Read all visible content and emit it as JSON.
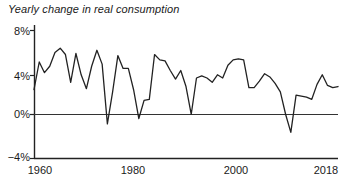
{
  "chart_data": {
    "type": "line",
    "title": "Yearly change in real consumption",
    "xlabel": "",
    "ylabel": "",
    "grid": false,
    "legend": null,
    "xlim": [
      1960,
      2018
    ],
    "ylim": [
      -4,
      8
    ],
    "yticks": [
      8,
      4,
      0,
      -4
    ],
    "ytick_labels": [
      "8%",
      "4%",
      "0%",
      "-4%"
    ],
    "xticks": [
      1960,
      1980,
      2000,
      2018
    ],
    "xtick_labels": [
      "1960",
      "1980",
      "2000",
      "2018"
    ],
    "zero_line": 0,
    "series": [
      {
        "name": "Yearly change in real consumption",
        "color": "#222222",
        "x": [
          1960,
          1961,
          1962,
          1963,
          1964,
          1965,
          1966,
          1967,
          1968,
          1969,
          1970,
          1971,
          1972,
          1973,
          1974,
          1975,
          1976,
          1977,
          1978,
          1979,
          1980,
          1981,
          1982,
          1983,
          1984,
          1985,
          1986,
          1987,
          1988,
          1989,
          1990,
          1991,
          1992,
          1993,
          1994,
          1995,
          1996,
          1997,
          1998,
          1999,
          2000,
          2001,
          2002,
          2003,
          2004,
          2005,
          2006,
          2007,
          2008,
          2009,
          2010,
          2011,
          2012,
          2013,
          2014,
          2015,
          2016,
          2017,
          2018
        ],
        "values": [
          2.4,
          5.0,
          4.0,
          4.6,
          5.9,
          6.3,
          5.7,
          3.1,
          5.8,
          3.8,
          2.5,
          4.6,
          6.1,
          4.8,
          -0.8,
          2.2,
          5.6,
          4.4,
          4.4,
          2.4,
          -0.3,
          1.4,
          1.5,
          5.7,
          5.2,
          5.1,
          4.2,
          3.4,
          4.2,
          2.7,
          0.1,
          3.5,
          3.7,
          3.5,
          3.1,
          3.8,
          3.5,
          4.7,
          5.2,
          5.3,
          5.2,
          2.6,
          2.6,
          3.2,
          3.9,
          3.6,
          3.0,
          2.2,
          0.1,
          -1.6,
          1.9,
          1.8,
          1.7,
          1.5,
          2.9,
          3.8,
          2.8,
          2.6,
          2.7
        ]
      }
    ]
  },
  "axis": {
    "y_labels": [
      "8%",
      "4%",
      "0%",
      "−4%"
    ],
    "x_labels": [
      "1960",
      "1980",
      "2000",
      "2018"
    ]
  }
}
